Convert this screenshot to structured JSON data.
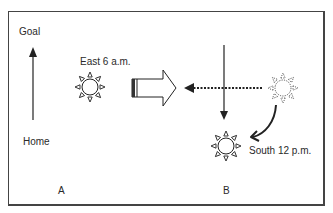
{
  "panels": {
    "A": {
      "panel_label": "A",
      "axis_top_label": "Goal",
      "axis_bottom_label": "Home",
      "sun_label": "East 6 a.m."
    },
    "B": {
      "panel_label": "B",
      "sun_label": "South 12 p.m."
    }
  },
  "colors": {
    "stroke": "#222222",
    "background": "#ffffff",
    "frame": "#444444"
  },
  "icons": {
    "sun_east": "sun-icon",
    "hollow_arrow": "hollow-right-arrow-icon",
    "sun_faded": "dotted-sun-icon",
    "sun_south": "sun-icon"
  }
}
